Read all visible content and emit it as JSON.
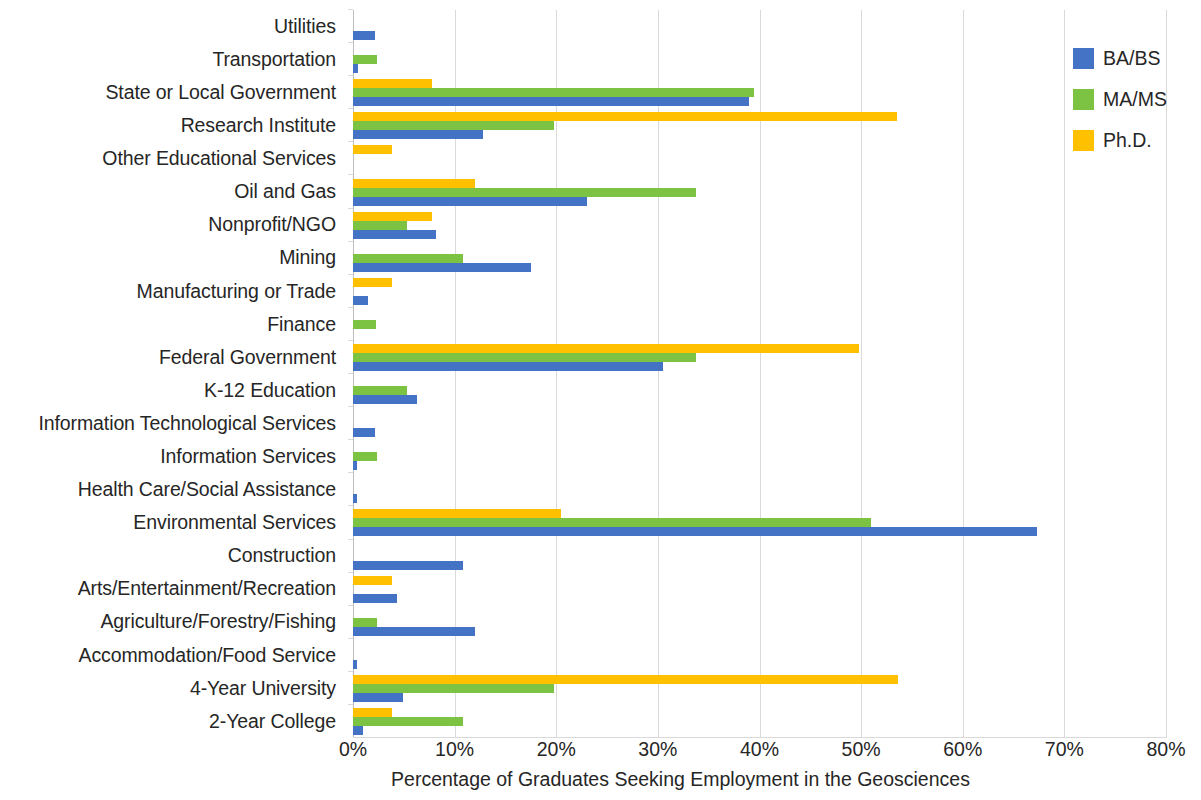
{
  "chart_data": {
    "type": "bar",
    "orientation": "horizontal",
    "title": "",
    "xlabel": "Percentage of Graduates Seeking Employment in the Geosciences",
    "ylabel": "",
    "xlim": [
      0,
      80
    ],
    "xticks": [
      "0%",
      "10%",
      "20%",
      "30%",
      "40%",
      "50%",
      "60%",
      "70%",
      "80%"
    ],
    "xtick_values": [
      0,
      10,
      20,
      30,
      40,
      50,
      60,
      70,
      80
    ],
    "grid": true,
    "legend_position": "top-right",
    "categories": [
      "Utilities",
      "Transportation",
      "State or Local Government",
      "Research Institute",
      "Other Educational Services",
      "Oil and Gas",
      "Nonprofit/NGO",
      "Mining",
      "Manufacturing or Trade",
      "Finance",
      "Federal Government",
      "K-12 Education",
      "Information Technological Services",
      "Information Services",
      "Health Care/Social Assistance",
      "Environmental Services",
      "Construction",
      "Arts/Entertainment/Recreation",
      "Agriculture/Forestry/Fishing",
      "Accommodation/Food Service",
      "4-Year University",
      "2-Year College"
    ],
    "series": [
      {
        "name": "BA/BS",
        "color": "#4472c4",
        "values": [
          2.2,
          0.5,
          39.0,
          12.8,
          0,
          23.0,
          8.2,
          17.5,
          1.5,
          0,
          30.5,
          6.3,
          2.2,
          0.4,
          0.4,
          67.3,
          10.8,
          4.3,
          12.0,
          0.4,
          4.9,
          1.0
        ]
      },
      {
        "name": "MA/MS",
        "color": "#7cc243",
        "values": [
          0,
          2.4,
          39.5,
          19.8,
          0,
          33.8,
          5.3,
          10.8,
          0,
          2.3,
          33.8,
          5.3,
          0,
          2.4,
          0,
          51.0,
          0,
          0,
          2.4,
          0,
          19.8,
          10.8
        ]
      },
      {
        "name": "Ph.D.",
        "color": "#ffc000",
        "values": [
          0,
          0,
          7.8,
          53.5,
          3.8,
          12.0,
          7.8,
          0,
          3.8,
          0,
          49.8,
          0,
          0,
          0,
          0,
          20.5,
          0,
          3.8,
          0,
          0,
          53.6,
          3.8
        ]
      }
    ]
  },
  "legend": {
    "items": [
      {
        "label": "BA/BS",
        "color": "#4472c4"
      },
      {
        "label": "MA/MS",
        "color": "#7cc243"
      },
      {
        "label": "Ph.D.",
        "color": "#ffc000"
      }
    ]
  }
}
